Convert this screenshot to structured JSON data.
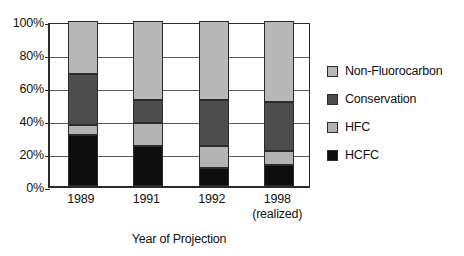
{
  "chart_data": {
    "type": "bar",
    "subtype": "stacked-100-percent",
    "title": "",
    "xlabel": "Year of Projection",
    "ylabel": "",
    "categories": [
      "1989",
      "1991",
      "1992",
      "1998"
    ],
    "category_sublabels": [
      "",
      "",
      "",
      "(realized)"
    ],
    "series": [
      {
        "name": "HCFC",
        "values": [
          31,
          24,
          11,
          13
        ],
        "color": "#0d0d0d"
      },
      {
        "name": "HFC",
        "values": [
          6,
          14,
          13,
          8
        ],
        "color": "#b3b3b3"
      },
      {
        "name": "Conservation",
        "values": [
          31,
          14,
          28,
          30
        ],
        "color": "#4d4d4d"
      },
      {
        "name": "Non-Fluorocarbon",
        "values": [
          32,
          48,
          48,
          49
        ],
        "color": "#b8b8b8"
      }
    ],
    "stack_order_bottom_to_top": [
      "HCFC",
      "HFC",
      "Conservation",
      "Non-Fluorocarbon"
    ],
    "ylim": [
      0,
      100
    ],
    "ytick_values": [
      0,
      20,
      40,
      60,
      80,
      100
    ],
    "ytick_labels": [
      "0%",
      "20%",
      "40%",
      "60%",
      "80%",
      "100%"
    ],
    "grid": true,
    "grid_axis": "y",
    "legend_position": "right",
    "legend_order": [
      "Non-Fluorocarbon",
      "Conservation",
      "HFC",
      "HCFC"
    ]
  },
  "legend": {
    "items": [
      {
        "label": "Non-Fluorocarbon",
        "color": "#b8b8b8"
      },
      {
        "label": "Conservation",
        "color": "#4d4d4d"
      },
      {
        "label": "HFC",
        "color": "#b3b3b3"
      },
      {
        "label": "HCFC",
        "color": "#0d0d0d"
      }
    ]
  },
  "axis": {
    "x_title": "Year of Projection",
    "y_ticks": [
      "100%",
      "80%",
      "60%",
      "40%",
      "20%",
      "0%"
    ],
    "x_ticks": [
      {
        "label": "1989",
        "sub": ""
      },
      {
        "label": "1991",
        "sub": ""
      },
      {
        "label": "1992",
        "sub": ""
      },
      {
        "label": "1998",
        "sub": "(realized)"
      }
    ]
  },
  "style": {
    "axis_color": "#2b2b2b",
    "grid_color": "#5a5a5a",
    "text_color": "#111111",
    "background": "#ffffff"
  }
}
